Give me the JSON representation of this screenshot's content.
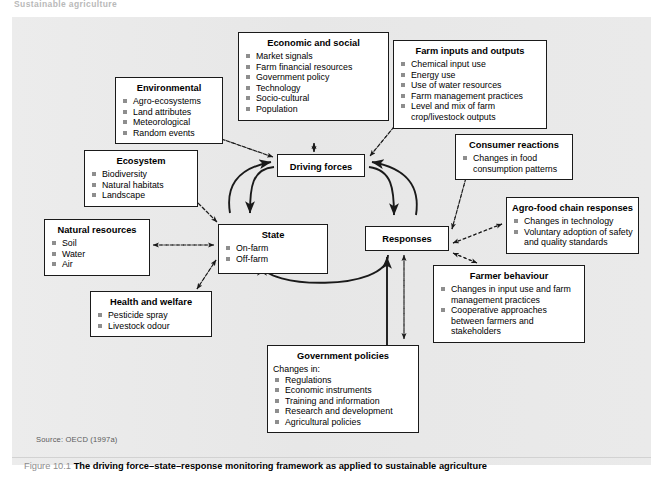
{
  "running_head": "Sustainable agriculture",
  "figure": {
    "source": "Source: OECD (1997a)",
    "number": "Figure 10.1",
    "caption": "The driving force–state–response monitoring framework as applied to sustainable agriculture"
  },
  "colors": {
    "panel_background": "#e9e9e9",
    "box_background": "#ffffff",
    "box_border": "#1a1a1a",
    "bullet": "#8e8e8e",
    "connector": "#1a1a1a",
    "caption_label": "#8d8d8d",
    "source_text": "#5b5b5b"
  },
  "core_boxes": {
    "driving_forces": {
      "title": "Driving forces"
    },
    "state": {
      "title": "State",
      "items": [
        "On-farm",
        "Off-farm"
      ]
    },
    "responses": {
      "title": "Responses"
    }
  },
  "boxes": [
    {
      "id": "economic_and_social",
      "title": "Economic and social",
      "items": [
        "Market signals",
        "Farm financial resources",
        "Government policy",
        "Technology",
        "Socio-cultural",
        "Population"
      ]
    },
    {
      "id": "farm_inputs_and_outputs",
      "title": "Farm inputs and outputs",
      "items": [
        "Chemical input use",
        "Energy use",
        "Use of water resources",
        "Farm management practices",
        "Level and mix of farm"
      ],
      "continuation": "crop/livestock outputs"
    },
    {
      "id": "environmental",
      "title": "Environmental",
      "items": [
        "Agro-ecosystems",
        "Land attributes",
        "Meteorological",
        "Random events"
      ]
    },
    {
      "id": "consumer_reactions",
      "title": "Consumer reactions",
      "items": [
        "Changes in food"
      ],
      "continuation": "consumption patterns"
    },
    {
      "id": "ecosystem",
      "title": "Ecosystem",
      "items": [
        "Biodiversity",
        "Natural habitats",
        "Landscape"
      ]
    },
    {
      "id": "agro_food_chain_responses",
      "title": "Agro-food chain responses",
      "items": [
        "Changes in technology",
        "Voluntary adoption of safety"
      ],
      "continuation": "and quality standards"
    },
    {
      "id": "natural_resources",
      "title": "Natural resources",
      "items": [
        "Soil",
        "Water",
        "Air"
      ]
    },
    {
      "id": "farmer_behaviour",
      "title": "Farmer behaviour",
      "items": [
        "Changes in input use and farm",
        "Cooperative approaches"
      ],
      "continuations": [
        "management practices",
        "between farmers and",
        "stakeholders"
      ]
    },
    {
      "id": "health_and_welfare",
      "title": "Health and welfare",
      "items": [
        "Pesticide spray",
        "Livestock odour"
      ]
    },
    {
      "id": "government_policies",
      "title": "Government policies",
      "lead": "Changes in:",
      "items": [
        "Regulations",
        "Economic instruments",
        "Training and information",
        "Research and development",
        "Agricultural policies"
      ]
    }
  ]
}
